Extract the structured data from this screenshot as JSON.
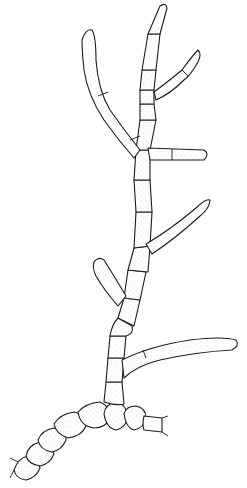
{
  "figure": {
    "type": "line-drawing",
    "background": "#ffffff",
    "ink": "#1a1a1a",
    "width": 247,
    "height": 488,
    "parts": [
      {
        "name": "main-axis",
        "description": "erect stipple-shaded filament of cylindrical cells rising from prostrate base"
      },
      {
        "name": "top-apex",
        "description": "tapering apical cell at top"
      },
      {
        "name": "left-upper-branch",
        "description": "long curved branch arching up-left"
      },
      {
        "name": "right-upper-branch",
        "description": "short narrow branch near apex, pointing up-right"
      },
      {
        "name": "right-middle-branch",
        "description": "short horizontal branch with septum"
      },
      {
        "name": "right-lower-branch",
        "description": "branch rising diagonally up-right"
      },
      {
        "name": "left-lower-branch",
        "description": "short club-shaped branch up-left"
      },
      {
        "name": "right-basal-branch",
        "description": "long tapering branch extending right"
      },
      {
        "name": "prostrate-filament",
        "description": "moniliform chain of rounded barrel cells along bottom"
      }
    ]
  }
}
